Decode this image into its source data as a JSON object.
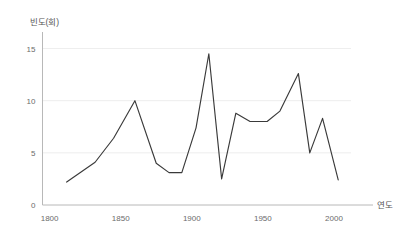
{
  "chart_data": {
    "type": "line",
    "title": "",
    "subtitle": "",
    "xlabel": "연도",
    "ylabel": "빈도(회)",
    "xlim": [
      1795,
      2012
    ],
    "ylim": [
      0,
      16.2
    ],
    "grid": true,
    "legend": false,
    "legend_position": "none",
    "xticks": [
      1800,
      1850,
      1900,
      1950,
      2000
    ],
    "xtick_labels": [
      "1800",
      "1850",
      "1900",
      "1950",
      "2000"
    ],
    "yticks": [
      0,
      5,
      10,
      15
    ],
    "ytick_labels": [
      "0",
      "5",
      "10",
      "15"
    ],
    "line_color": "#3a3a3a",
    "grid_color": "#e9e9e9",
    "axis_color": "#b8b8b8",
    "background_color": "#ffffff",
    "series": [
      {
        "name": "빈도(회)",
        "x": [
          1812,
          1832,
          1845,
          1860,
          1875,
          1884,
          1893,
          1903,
          1912,
          1921,
          1931,
          1941,
          1953,
          1962,
          1975,
          1983,
          1992,
          2003
        ],
        "values": [
          2.2,
          4.1,
          6.4,
          10.0,
          4.0,
          3.1,
          3.1,
          7.4,
          14.5,
          2.5,
          8.8,
          8.0,
          8.0,
          9.0,
          12.6,
          5.0,
          8.3,
          2.4
        ]
      }
    ],
    "annotations": []
  }
}
